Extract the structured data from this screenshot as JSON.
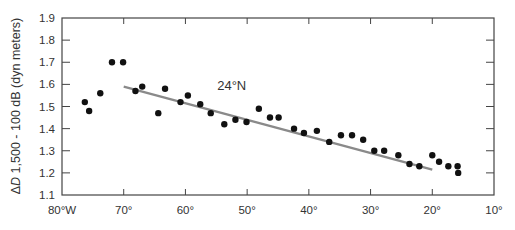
{
  "chart_data": {
    "type": "scatter",
    "title": "",
    "xlabel": "",
    "ylabel": "ΔD 1,500 - 100 dB (dyn meters)",
    "ylabel_italic": "D",
    "ylabel_prefix": "Δ",
    "ylabel_rest": " 1,500 - 100 dB (dyn meters)",
    "xlim": [
      80,
      10
    ],
    "ylim": [
      1.1,
      1.9
    ],
    "x_ticks": [
      80,
      70,
      60,
      50,
      40,
      30,
      20,
      10
    ],
    "x_tick_labels": [
      "80°W",
      "70°",
      "60°",
      "50°",
      "40°",
      "30°",
      "20°",
      "10°"
    ],
    "y_ticks": [
      1.1,
      1.2,
      1.3,
      1.4,
      1.5,
      1.6,
      1.7,
      1.8,
      1.9
    ],
    "y_tick_labels": [
      "1.1",
      "1.2",
      "1.3",
      "1.4",
      "1.5",
      "1.6",
      "1.7",
      "1.8",
      "1.9"
    ],
    "grid": false,
    "annotation": {
      "text": "24°N",
      "x": 52.5,
      "y": 1.575
    },
    "series": [
      {
        "name": "observations",
        "type": "scatter",
        "points": [
          [
            76.3,
            1.52
          ],
          [
            75.6,
            1.48
          ],
          [
            73.8,
            1.56
          ],
          [
            71.9,
            1.7
          ],
          [
            70.1,
            1.7
          ],
          [
            68.1,
            1.57
          ],
          [
            67.0,
            1.59
          ],
          [
            64.4,
            1.47
          ],
          [
            63.3,
            1.58
          ],
          [
            60.8,
            1.52
          ],
          [
            59.6,
            1.55
          ],
          [
            57.6,
            1.51
          ],
          [
            55.9,
            1.47
          ],
          [
            53.7,
            1.42
          ],
          [
            51.9,
            1.44
          ],
          [
            50.1,
            1.43
          ],
          [
            48.1,
            1.49
          ],
          [
            46.3,
            1.45
          ],
          [
            44.9,
            1.45
          ],
          [
            42.4,
            1.4
          ],
          [
            40.8,
            1.38
          ],
          [
            38.7,
            1.39
          ],
          [
            36.7,
            1.34
          ],
          [
            34.8,
            1.37
          ],
          [
            33.0,
            1.37
          ],
          [
            31.2,
            1.35
          ],
          [
            29.4,
            1.3
          ],
          [
            27.8,
            1.3
          ],
          [
            25.5,
            1.28
          ],
          [
            23.7,
            1.24
          ],
          [
            22.1,
            1.23
          ],
          [
            20.0,
            1.28
          ],
          [
            18.9,
            1.25
          ],
          [
            17.4,
            1.23
          ],
          [
            15.9,
            1.23
          ],
          [
            15.8,
            1.2
          ]
        ]
      },
      {
        "name": "linear fit 24°N",
        "type": "line",
        "points": [
          [
            70.0,
            1.59
          ],
          [
            20.0,
            1.215
          ]
        ]
      }
    ]
  }
}
